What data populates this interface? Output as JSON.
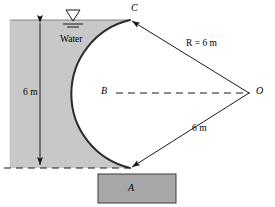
{
  "figure": {
    "kind": "engineering-diagram",
    "background_color": "#ffffff",
    "water_fill_color": "#c8c8c8",
    "block_fill_color": "#a8a8a8",
    "line_color": "#1a1a1a",
    "labels": {
      "point_c": "C",
      "point_b": "B",
      "point_a": "A",
      "point_o": "O",
      "radius_upper": "R = 6 m",
      "radius_lower": "6 m",
      "depth": "6 m",
      "water": "Water"
    },
    "icons": {
      "water_surface": "water-level-triangle-icon",
      "arrow_up": "arrowhead-up-icon",
      "arrow_down": "arrowhead-down-icon"
    },
    "caption": ""
  }
}
